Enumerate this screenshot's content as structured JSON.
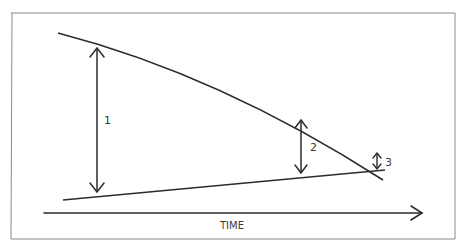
{
  "diagram": {
    "type": "converging-gap-over-time",
    "colors": {
      "background": "#ffffff",
      "stroke": "#2b2b2b",
      "frame": "#8a8a8a",
      "text": "#3a3a3a"
    },
    "axis": {
      "label": "TIME"
    },
    "gaps": [
      {
        "label": "1"
      },
      {
        "label": "2"
      },
      {
        "label": "3"
      }
    ]
  }
}
